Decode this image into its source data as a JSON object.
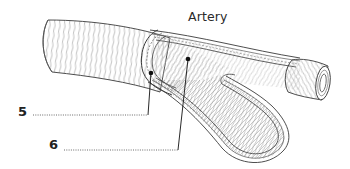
{
  "diagram": {
    "title": "Artery",
    "labels": [
      {
        "number": "5",
        "answer": "",
        "points_to": "inner lining (wall layer) of artery"
      },
      {
        "number": "6",
        "answer": "",
        "points_to": "lumen of artery"
      }
    ],
    "colors": {
      "line": "#3a3a3a",
      "hatch": "#8a8a8a",
      "background": "#ffffff",
      "label": "#222222"
    }
  }
}
